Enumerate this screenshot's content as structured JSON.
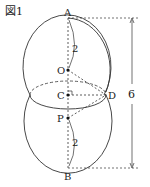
{
  "figure_label": "図1",
  "points": {
    "A": "A",
    "O": "O",
    "C": "C",
    "D": "D",
    "P": "P",
    "B": "B"
  },
  "dims": {
    "AO": "2",
    "PB": "2",
    "AB": "6"
  },
  "colors": {
    "stroke": "#333333"
  }
}
